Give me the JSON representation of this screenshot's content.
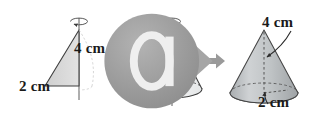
{
  "figure": {
    "badge": {
      "name": "media-badge-icon",
      "glyph": "cd-play"
    },
    "steps": [
      {
        "id": "triangle",
        "name": "right-triangle-with-rotation-axis",
        "shape": "right triangle",
        "labels": [
          {
            "id": "triangle-height",
            "text": "4 cm",
            "measures": "height"
          },
          {
            "id": "triangle-base",
            "text": "2 cm",
            "measures": "base"
          }
        ],
        "rotation_axis": "vertical",
        "rotation_indicator": "ellipse-arrow"
      },
      {
        "id": "wireframe-cone",
        "name": "wireframe-cone-with-rotation-axis",
        "shape": "cone",
        "labels": [],
        "rotation_axis": "vertical",
        "rotation_indicator": "ellipse-arrow"
      },
      {
        "id": "solid-cone",
        "name": "solid-shaded-cone",
        "shape": "cone",
        "labels": [
          {
            "id": "cone-height",
            "text": "4 cm",
            "measures": "height"
          },
          {
            "id": "cone-radius",
            "text": "2 cm",
            "measures": "radius"
          }
        ],
        "rotation_axis": "none",
        "rotation_indicator": "none"
      }
    ],
    "arrows": [
      {
        "id": "arrow-1",
        "direction": "right"
      },
      {
        "id": "arrow-2",
        "direction": "right"
      }
    ],
    "colors": {
      "background": "#ffffff",
      "outline": "#3a3a3a",
      "triangle_fill": "#d6d6d6",
      "cone_fill_light": "#eceded",
      "cone_fill_solid": "#b9bcbe",
      "arrow": "#9a9a9a",
      "badge": "#9b9b9b",
      "text": "#1a1a1a"
    }
  }
}
